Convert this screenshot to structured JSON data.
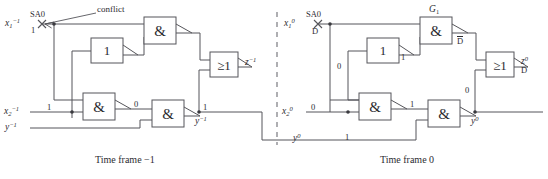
{
  "figure": {
    "type": "logic-circuit-timeframe-expansion",
    "captions": {
      "left": "Time frame  −1",
      "right": "Time frame  0"
    },
    "annotations": {
      "conflict": "conflict"
    },
    "colors": {
      "wire": "#55555a",
      "text": "#2c2c31",
      "divider": "#8d8d92",
      "background": "#ffffff"
    }
  },
  "left_frame": {
    "name": "Time frame -1",
    "inputs": [
      {
        "id": "x1m1",
        "base": "x",
        "sub": "1",
        "sup": "−1",
        "value": "1"
      },
      {
        "id": "x2m1",
        "base": "x",
        "sub": "2",
        "sup": "−1",
        "value": "1"
      },
      {
        "id": "ym1",
        "base": "y",
        "sub": "",
        "sup": "−1",
        "value": ""
      }
    ],
    "fault": {
      "label": "SA0",
      "marker": "x-cross",
      "value": "1"
    },
    "gates": [
      {
        "id": "inv-l",
        "symbol": "1",
        "kind": "inverter",
        "label": ""
      },
      {
        "id": "and-top-l",
        "symbol": "&",
        "kind": "and-inverted-out",
        "label": ""
      },
      {
        "id": "and-mid-l",
        "symbol": "&",
        "kind": "and-inverted-out",
        "label": ""
      },
      {
        "id": "and-low-l",
        "symbol": "&",
        "kind": "and-inverted-out",
        "label": ""
      },
      {
        "id": "or-l",
        "symbol": "≥1",
        "kind": "or-inverted-out",
        "label": ""
      }
    ],
    "wire_values": [
      {
        "id": "x1-val",
        "text": "1"
      },
      {
        "id": "x2-val",
        "text": "1"
      },
      {
        "id": "and-mid-out",
        "text": "0"
      },
      {
        "id": "y-fb",
        "text": "1"
      }
    ],
    "outputs": [
      {
        "id": "zm1",
        "base": "z",
        "sub": "",
        "sup": "−1",
        "value": ""
      },
      {
        "id": "ym1-out",
        "base": "y",
        "sub": "",
        "sup": "−1",
        "value": ""
      }
    ]
  },
  "right_frame": {
    "name": "Time frame 0",
    "inputs": [
      {
        "id": "x10",
        "base": "x",
        "sub": "1",
        "sup": "0",
        "value": "D"
      },
      {
        "id": "x20",
        "base": "x",
        "sub": "2",
        "sup": "0",
        "value": "0"
      },
      {
        "id": "y0",
        "base": "y",
        "sub": "",
        "sup": "0",
        "value": "1"
      }
    ],
    "fault": {
      "label": "SA0",
      "marker": "x-cross",
      "value": "D"
    },
    "gates": [
      {
        "id": "inv-r",
        "symbol": "1",
        "kind": "inverter",
        "label": ""
      },
      {
        "id": "and-top-r",
        "symbol": "&",
        "kind": "and-inverted-out",
        "label": "G₁",
        "label_base": "G",
        "label_sub": "1"
      },
      {
        "id": "and-mid-r",
        "symbol": "&",
        "kind": "and-inverted-out",
        "label": ""
      },
      {
        "id": "and-low-r",
        "symbol": "&",
        "kind": "and-inverted-out",
        "label": ""
      },
      {
        "id": "or-r",
        "symbol": "≥1",
        "kind": "or-inverted-out",
        "label": ""
      }
    ],
    "wire_values": [
      {
        "id": "x1-val-r",
        "text": "D"
      },
      {
        "id": "inv-out-r",
        "text": "1"
      },
      {
        "id": "inv-in-r",
        "text": "0"
      },
      {
        "id": "x2-val-r",
        "text": "0"
      },
      {
        "id": "and-top-out-r",
        "text": "D̄"
      },
      {
        "id": "and-mid-out-r",
        "text": "1"
      },
      {
        "id": "and-low-out-r",
        "text": "0"
      },
      {
        "id": "y-fb-r",
        "text": "1"
      }
    ],
    "outputs": [
      {
        "id": "z0",
        "base": "z",
        "sub": "",
        "sup": "0",
        "value": "D"
      },
      {
        "id": "y0-out",
        "base": "y",
        "sub": "",
        "sup": "0",
        "value": ""
      }
    ]
  }
}
